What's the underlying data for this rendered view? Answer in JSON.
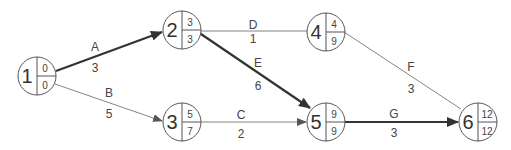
{
  "diagram": {
    "type": "activity-on-arrow network",
    "nodes": [
      {
        "id": "1",
        "early": "0",
        "late": "0"
      },
      {
        "id": "2",
        "early": "3",
        "late": "3"
      },
      {
        "id": "3",
        "early": "5",
        "late": "7"
      },
      {
        "id": "4",
        "early": "4",
        "late": "9"
      },
      {
        "id": "5",
        "early": "9",
        "late": "9"
      },
      {
        "id": "6",
        "early": "12",
        "late": "12"
      }
    ],
    "edges": [
      {
        "activity": "A",
        "duration": "3",
        "from": "1",
        "to": "2",
        "critical": true
      },
      {
        "activity": "B",
        "duration": "5",
        "from": "1",
        "to": "3",
        "critical": false
      },
      {
        "activity": "C",
        "duration": "2",
        "from": "3",
        "to": "5",
        "critical": false
      },
      {
        "activity": "D",
        "duration": "1",
        "from": "2",
        "to": "4",
        "critical": false
      },
      {
        "activity": "E",
        "duration": "6",
        "from": "2",
        "to": "5",
        "critical": true
      },
      {
        "activity": "F",
        "duration": "3",
        "from": "4",
        "to": "6",
        "critical": false
      },
      {
        "activity": "G",
        "duration": "3",
        "from": "5",
        "to": "6",
        "critical": true
      }
    ],
    "colors": {
      "critical_path": "#333333",
      "normal_path": "#777777",
      "node_stroke": "#555555"
    }
  }
}
